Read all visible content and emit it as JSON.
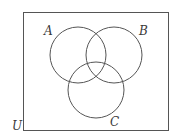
{
  "diagram": {
    "type": "venn",
    "sets": 3,
    "universe": {
      "label": "U",
      "rect": {
        "x": 23.5,
        "y": 12.5,
        "width": 145,
        "height": 118
      }
    },
    "circles": [
      {
        "id": "A",
        "label": "A",
        "cx": 78,
        "cy": 55,
        "r": 28
      },
      {
        "id": "B",
        "label": "B",
        "cx": 114,
        "cy": 55,
        "r": 28
      },
      {
        "id": "C",
        "label": "C",
        "cx": 96,
        "cy": 90,
        "r": 28
      }
    ],
    "labels": {
      "A": {
        "text": "A",
        "x": 44,
        "y": 35
      },
      "B": {
        "text": "B",
        "x": 139,
        "y": 35
      },
      "C": {
        "text": "C",
        "x": 110,
        "y": 126
      },
      "U": {
        "text": "U",
        "x": 12,
        "y": 130
      }
    },
    "stroke_color": "#555555",
    "background_color": "#ffffff"
  }
}
